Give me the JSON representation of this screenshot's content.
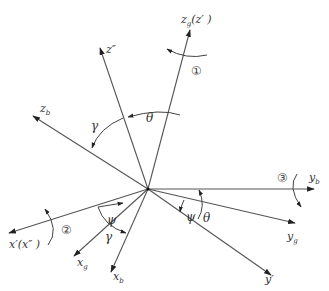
{
  "diagram": {
    "type": "coordinate-frame-rotation",
    "line_color": "#555555",
    "text_color": "#333333",
    "origin": {
      "x": 148,
      "y": 189
    },
    "axes": [
      {
        "id": "zg",
        "label": "z_g(z′)",
        "main": "z",
        "sub": "g",
        "suffix": "(z′ )",
        "tip": {
          "x": 190,
          "y": 30
        },
        "label_pos": {
          "x": 181,
          "y": 23
        }
      },
      {
        "id": "z2",
        "label": "z″",
        "main": "z″",
        "sub": "",
        "suffix": "",
        "tip": {
          "x": 100,
          "y": 48
        },
        "label_pos": {
          "x": 106,
          "y": 53
        }
      },
      {
        "id": "zb",
        "label": "z_b",
        "main": "z",
        "sub": "b",
        "suffix": "",
        "tip": {
          "x": 33,
          "y": 116
        },
        "label_pos": {
          "x": 40,
          "y": 112
        }
      },
      {
        "id": "yb",
        "label": "y_b",
        "main": "y",
        "sub": "b",
        "suffix": "",
        "tip": {
          "x": 314,
          "y": 189
        },
        "label_pos": {
          "x": 309,
          "y": 181
        }
      },
      {
        "id": "yg",
        "label": "y_g",
        "main": "y",
        "sub": "g",
        "suffix": "",
        "tip": {
          "x": 295,
          "y": 223
        },
        "label_pos": {
          "x": 287,
          "y": 240
        }
      },
      {
        "id": "y1",
        "label": "y′",
        "main": "y′",
        "sub": "",
        "suffix": "",
        "tip": {
          "x": 271,
          "y": 275
        },
        "label_pos": {
          "x": 265,
          "y": 283
        }
      },
      {
        "id": "x1",
        "label": "x′(x″)",
        "main": "x′(x″ )",
        "sub": "",
        "suffix": "",
        "tip": {
          "x": 9,
          "y": 233
        },
        "label_pos": {
          "x": 9,
          "y": 248
        }
      },
      {
        "id": "xg",
        "label": "x_g",
        "main": "x",
        "sub": "g",
        "suffix": "",
        "tip": {
          "x": 74,
          "y": 256
        },
        "label_pos": {
          "x": 77,
          "y": 266
        }
      },
      {
        "id": "xb",
        "label": "x_b",
        "main": "x",
        "sub": "b",
        "suffix": "",
        "tip": {
          "x": 111,
          "y": 272
        },
        "label_pos": {
          "x": 113,
          "y": 280
        }
      }
    ],
    "angles": [
      {
        "symbol": "θ",
        "pos": {
          "x": 146,
          "y": 122
        }
      },
      {
        "symbol": "γ",
        "pos": {
          "x": 91,
          "y": 130
        }
      },
      {
        "symbol": "ψ",
        "pos": {
          "x": 107,
          "y": 224
        }
      },
      {
        "symbol": "γ",
        "pos": {
          "x": 105,
          "y": 241
        }
      },
      {
        "symbol": "ψ",
        "pos": {
          "x": 186,
          "y": 221
        }
      },
      {
        "symbol": "θ",
        "pos": {
          "x": 203,
          "y": 222
        }
      }
    ],
    "rotation_markers": [
      {
        "label": "①",
        "pos": {
          "x": 191,
          "y": 75
        }
      },
      {
        "label": "②",
        "pos": {
          "x": 61,
          "y": 234
        }
      },
      {
        "label": "③",
        "pos": {
          "x": 277,
          "y": 182
        }
      }
    ]
  }
}
